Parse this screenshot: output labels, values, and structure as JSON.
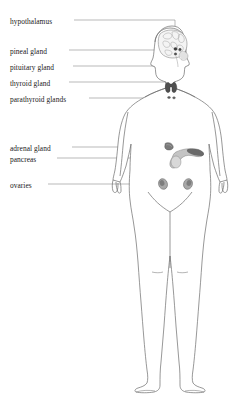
{
  "diagram": {
    "line_color": "#6b6b6b",
    "leader_color": "#8a8a8a",
    "text_color": "#1a1a1a",
    "background": "#ffffff",
    "labels": [
      {
        "id": "hypothalamus",
        "text": "hypothalamus",
        "x": 10,
        "y": 17,
        "leader": "horizontal-then-down-into-brain"
      },
      {
        "id": "pineal-gland",
        "text": "pineal gland",
        "x": 10,
        "y": 47,
        "leader": "horizontal-to-brain"
      },
      {
        "id": "pituitary-gland",
        "text": "pituitary gland",
        "x": 10,
        "y": 63,
        "leader": "horizontal-to-brain-base"
      },
      {
        "id": "thyroid-gland",
        "text": "thyroid gland",
        "x": 10,
        "y": 79,
        "leader": "horizontal-to-neck"
      },
      {
        "id": "parathyroid-glands",
        "text": "parathyroid glands",
        "x": 10,
        "y": 95,
        "leader": "horizontal-to-below-thyroid"
      },
      {
        "id": "adrenal-gland",
        "text": "adrenal gland",
        "x": 10,
        "y": 144,
        "leader": "horizontal-to-abdomen"
      },
      {
        "id": "pancreas",
        "text": "pancreas",
        "x": 10,
        "y": 155,
        "leader": "horizontal-to-abdomen"
      },
      {
        "id": "ovaries",
        "text": "ovaries",
        "x": 10,
        "y": 181,
        "leader": "horizontal-to-pelvis"
      }
    ],
    "organs": [
      {
        "id": "brain",
        "name": "brain-cerebrum",
        "shade": "#f0f0f0"
      },
      {
        "id": "hypothalamus-marker",
        "name": "hypothalamus-gland",
        "shade": "#4a4a4a"
      },
      {
        "id": "pineal-marker",
        "name": "pineal-gland",
        "shade": "#555555"
      },
      {
        "id": "pituitary-marker",
        "name": "pituitary-gland",
        "shade": "#5a5a5a"
      },
      {
        "id": "thyroid",
        "name": "thyroid-gland",
        "shade": "#4f4f4f"
      },
      {
        "id": "parathyroid",
        "name": "parathyroid-glands",
        "shade": "#5a5a5a"
      },
      {
        "id": "adrenal",
        "name": "adrenal-gland",
        "shade": "#707070"
      },
      {
        "id": "pancreas-organ",
        "name": "pancreas",
        "shade": "#b8b8b8"
      },
      {
        "id": "ovary-left",
        "name": "ovary-left",
        "shade": "#9a9a9a"
      },
      {
        "id": "ovary-right",
        "name": "ovary-right",
        "shade": "#9a9a9a"
      }
    ]
  }
}
